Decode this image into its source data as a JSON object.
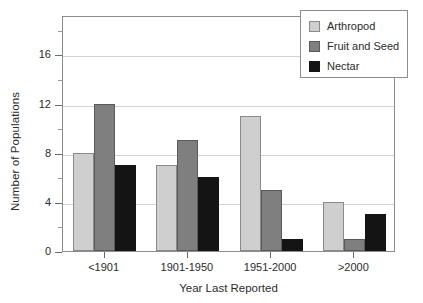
{
  "chart_data": {
    "type": "bar",
    "title": "",
    "xlabel": "Year Last Reported",
    "ylabel": "Number of Populations",
    "categories": [
      "<1901",
      "1901-1950",
      "1951-2000",
      ">2000"
    ],
    "series": [
      {
        "name": "Arthropod",
        "color": "#cfcfcf",
        "values": [
          8,
          7,
          11,
          4
        ]
      },
      {
        "name": "Fruit and Seed",
        "color": "#7f7f7f",
        "values": [
          12,
          9,
          5,
          1
        ]
      },
      {
        "name": "Nectar",
        "color": "#141414",
        "values": [
          7,
          6,
          1,
          3
        ]
      }
    ],
    "ylim": [
      0,
      19.2
    ],
    "ytick_values": [
      0,
      4,
      8,
      12,
      16
    ],
    "ytick_labels": [
      "0",
      "4",
      "8",
      "12",
      "16"
    ],
    "yminor_values": [
      2,
      6,
      10,
      14,
      18
    ],
    "gridlines": [
      4,
      8,
      12,
      16
    ],
    "grid": true,
    "legend_position": "top-right",
    "legend_entries": [
      "Arthropod",
      "Fruit and Seed",
      "Nectar"
    ]
  }
}
